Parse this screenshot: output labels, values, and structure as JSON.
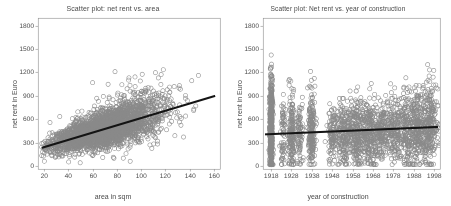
{
  "figure": {
    "background_color": "#ffffff",
    "panel_count": 2
  },
  "charts": {
    "left": {
      "title": "Scatter plot: net rent vs. area",
      "xlabel": "area in sqm",
      "ylabel": "net rent in Euro"
    },
    "right": {
      "title": "Scatter plot: Net rent vs. year of construction",
      "xlabel": "year of construction",
      "ylabel": "net rent in Euro"
    }
  },
  "chart_data": [
    {
      "type": "scatter",
      "id": "net-rent-vs-area",
      "title": "Scatter plot: net rent vs. area",
      "xlabel": "area in sqm",
      "ylabel": "net rent in Euro",
      "xlim": [
        15,
        165
      ],
      "ylim": [
        -40,
        1900
      ],
      "xticks": [
        20,
        40,
        60,
        80,
        100,
        120,
        140,
        160
      ],
      "yticks": [
        0,
        300,
        600,
        900,
        1200,
        1500,
        1800
      ],
      "grid": false,
      "legend": "none",
      "marker": {
        "shape": "circle-open",
        "color": "#8a8a8a",
        "size": 2.1,
        "line_width": 0.6
      },
      "n_points": 3000,
      "point_cloud": {
        "model": "linear-heteroscedastic",
        "x_distribution": "right-skewed",
        "x_mode": 68,
        "x_min": 18,
        "x_max": 162,
        "x_spread": 22,
        "intercept": 128,
        "slope": 5.0,
        "noise_sd_base": 62,
        "noise_sd_slope": 1.15,
        "y_clip_min": 20,
        "y_clip_max": 1860
      },
      "fit_line": {
        "label": "regression line",
        "color": "#141414",
        "width": 2.1,
        "x_start": 18,
        "y_start": 232,
        "x_end": 161,
        "y_end": 900
      }
    },
    {
      "type": "scatter",
      "id": "net-rent-vs-year",
      "title": "Scatter plot: Net rent vs. year of construction",
      "xlabel": "year of construction",
      "ylabel": "net rent in Euro",
      "xlim": [
        1914,
        2001
      ],
      "ylim": [
        -40,
        1900
      ],
      "xticks": [
        1918,
        1928,
        1938,
        1948,
        1958,
        1968,
        1978,
        1988,
        1998
      ],
      "yticks": [
        0,
        300,
        600,
        900,
        1200,
        1500,
        1800
      ],
      "grid": false,
      "legend": "none",
      "marker": {
        "shape": "circle-open",
        "color": "#8a8a8a",
        "size": 2.1,
        "line_width": 0.6
      },
      "n_points": 3000,
      "point_cloud": {
        "model": "year-clusters",
        "clusters": [
          {
            "year": 1918,
            "weight": 0.175,
            "jitter": 0.35,
            "mean": 480,
            "sd": 300,
            "ymax": 1860
          },
          {
            "year": 1924,
            "weight": 0.022,
            "jitter": 0.6,
            "mean": 440,
            "sd": 250,
            "ymax": 1180
          },
          {
            "year": 1928,
            "weight": 0.055,
            "jitter": 0.8,
            "mean": 440,
            "sd": 250,
            "ymax": 1180
          },
          {
            "year": 1932,
            "weight": 0.028,
            "jitter": 0.8,
            "mean": 420,
            "sd": 230,
            "ymax": 1100
          },
          {
            "year": 1938,
            "weight": 0.06,
            "jitter": 0.9,
            "mean": 430,
            "sd": 240,
            "ymax": 1250
          },
          {
            "year": 1948,
            "weight": 0.03,
            "jitter": 1.2,
            "mean": 400,
            "sd": 200,
            "ymax": 900
          },
          {
            "year": 1954,
            "weight": 0.07,
            "jitter": 2.0,
            "mean": 410,
            "sd": 200,
            "ymax": 1180
          },
          {
            "year": 1960,
            "weight": 0.08,
            "jitter": 2.2,
            "mean": 420,
            "sd": 210,
            "ymax": 1100
          },
          {
            "year": 1966,
            "weight": 0.075,
            "jitter": 2.2,
            "mean": 430,
            "sd": 215,
            "ymax": 1150
          },
          {
            "year": 1972,
            "weight": 0.06,
            "jitter": 2.2,
            "mean": 440,
            "sd": 215,
            "ymax": 1100
          },
          {
            "year": 1978,
            "weight": 0.055,
            "jitter": 2.0,
            "mean": 450,
            "sd": 220,
            "ymax": 1200
          },
          {
            "year": 1984,
            "weight": 0.065,
            "jitter": 2.2,
            "mean": 470,
            "sd": 230,
            "ymax": 1200
          },
          {
            "year": 1990,
            "weight": 0.07,
            "jitter": 2.2,
            "mean": 480,
            "sd": 235,
            "ymax": 1250
          },
          {
            "year": 1996,
            "weight": 0.085,
            "jitter": 2.0,
            "mean": 500,
            "sd": 250,
            "ymax": 1500
          }
        ],
        "y_clip_min": 15,
        "y_clip_max": 1860
      },
      "fit_line": {
        "label": "regression line",
        "color": "#141414",
        "width": 2.1,
        "x_start": 1915,
        "y_start": 405,
        "x_end": 2000,
        "y_end": 500
      }
    }
  ],
  "style": {
    "frame_color": "#8c8c8c",
    "tick_color": "#8c8c8c",
    "tick_label_color": "#4a4a4a",
    "point_color": "#8a8a8a",
    "line_color": "#141414",
    "tick_font_size": 6.6
  },
  "plot_boxes": {
    "left": {
      "x": 38,
      "y": 18,
      "w": 182,
      "h": 151
    },
    "right": {
      "x": 38,
      "y": 18,
      "w": 177,
      "h": 151
    }
  }
}
